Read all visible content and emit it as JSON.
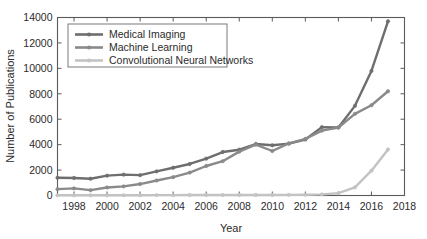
{
  "chart_data": {
    "type": "line",
    "title": "",
    "xlabel": "Year",
    "ylabel": "Number of Publications",
    "xlim": [
      1997,
      2018
    ],
    "ylim": [
      0,
      14000
    ],
    "xticks": [
      1998,
      2000,
      2002,
      2004,
      2006,
      2008,
      2010,
      2012,
      2014,
      2016,
      2018
    ],
    "yticks": [
      0,
      2000,
      4000,
      6000,
      8000,
      10000,
      12000,
      14000
    ],
    "xtick_labels": [
      "1998",
      "2000",
      "2002",
      "2004",
      "2006",
      "2008",
      "2010",
      "2012",
      "2014",
      "2016",
      "2018"
    ],
    "ytick_labels": [
      "0",
      "2000",
      "4000",
      "6000",
      "8000",
      "10000",
      "12000",
      "14000"
    ],
    "grid": false,
    "legend_position": "upper left",
    "x": [
      1997,
      1998,
      1999,
      2000,
      2001,
      2002,
      2003,
      2004,
      2005,
      2006,
      2007,
      2008,
      2009,
      2010,
      2011,
      2012,
      2013,
      2014,
      2015,
      2016,
      2017
    ],
    "series": [
      {
        "name": "Medical Imaging",
        "color": "#6e6e6e",
        "values": [
          1400,
          1380,
          1320,
          1560,
          1640,
          1600,
          1900,
          2180,
          2480,
          2900,
          3420,
          3600,
          4050,
          3950,
          4080,
          4400,
          5380,
          5350,
          7050,
          9800,
          13700
        ]
      },
      {
        "name": "Machine Learning",
        "color": "#8a8a8a",
        "values": [
          500,
          560,
          420,
          630,
          720,
          900,
          1180,
          1440,
          1800,
          2320,
          2700,
          3450,
          4000,
          3500,
          4100,
          4450,
          5100,
          5350,
          6420,
          7100,
          8200
        ]
      },
      {
        "name": "Convolutional Neural Networks",
        "color": "#c3c3c3",
        "values": [
          20,
          20,
          20,
          25,
          25,
          25,
          30,
          30,
          35,
          35,
          40,
          40,
          45,
          45,
          50,
          60,
          90,
          180,
          640,
          1950,
          3620
        ]
      }
    ]
  },
  "legend": {
    "entries": [
      {
        "label": "Medical Imaging"
      },
      {
        "label": "Machine Learning"
      },
      {
        "label": "Convolutional Neural Networks"
      }
    ]
  },
  "axes": {
    "x_title": "Year",
    "y_title": "Number of Publications"
  },
  "colors": {
    "medical_imaging": "#6e6e6e",
    "machine_learning": "#8a8a8a",
    "cnn": "#c3c3c3",
    "frame": "#5a5a5a",
    "text": "#2b2b2b",
    "background": "#ffffff"
  }
}
